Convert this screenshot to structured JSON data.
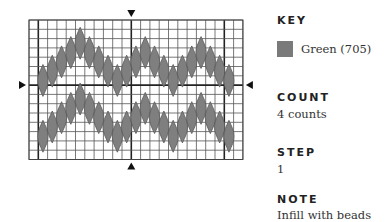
{
  "chart_data": {
    "type": "stitch-chart",
    "grid": {
      "columns": 23,
      "rows": 15,
      "origin_x": 29,
      "origin_y": 20,
      "cell": 9.3,
      "heavy_columns": [
        1,
        11,
        21
      ],
      "heavy_rows": [
        7
      ]
    },
    "center_markers": [
      "top",
      "bottom",
      "left",
      "right"
    ],
    "stitch_color": "#7f7f7f",
    "stitch_length_rows": 3,
    "waves": [
      {
        "name": "upper",
        "start_column": 1,
        "top_rows": [
          5,
          4,
          3,
          2,
          1,
          2,
          3,
          4,
          5,
          4,
          3,
          2,
          3,
          4,
          5,
          4,
          3,
          2,
          3,
          4,
          5
        ]
      },
      {
        "name": "lower",
        "start_column": 1,
        "top_rows": [
          11,
          10,
          9,
          8,
          7,
          8,
          9,
          10,
          11,
          10,
          9,
          8,
          9,
          10,
          11,
          10,
          9,
          8,
          9,
          10,
          11
        ]
      }
    ]
  },
  "key": {
    "heading": "KEY",
    "items": [
      {
        "label": "Green (705)",
        "color": "#7a7a7a"
      }
    ]
  },
  "count": {
    "heading": "COUNT",
    "value": "4 counts"
  },
  "step": {
    "heading": "STEP",
    "value": "1"
  },
  "note": {
    "heading": "NOTE",
    "value": "Infill with beads"
  }
}
